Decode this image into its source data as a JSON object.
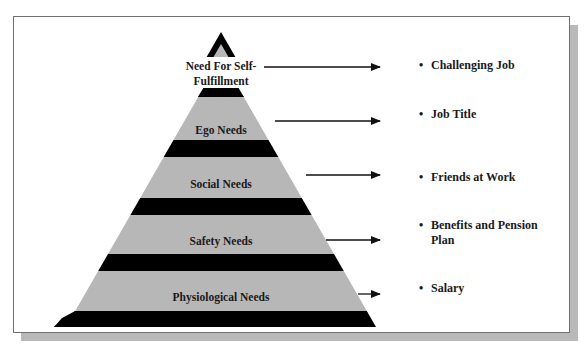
{
  "diagram": {
    "title": "",
    "colors": {
      "band_fill": "#b7b7b7",
      "divider_fill": "#000000",
      "frame_border": "#6f6f6f",
      "shadow": "#b9b9b9",
      "text": "#1a1a1a"
    },
    "levels": [
      {
        "label_line1": "Need For Self-",
        "label_line2": "Fulfillment",
        "example_line1": "Challenging Job",
        "example_line2": ""
      },
      {
        "label_line1": "Ego Needs",
        "label_line2": "",
        "example_line1": "Job Title",
        "example_line2": ""
      },
      {
        "label_line1": "Social Needs",
        "label_line2": "",
        "example_line1": "Friends at Work",
        "example_line2": ""
      },
      {
        "label_line1": "Safety Needs",
        "label_line2": "",
        "example_line1": "Benefits and Pension",
        "example_line2": "Plan"
      },
      {
        "label_line1": "Physiological Needs",
        "label_line2": "",
        "example_line1": "Salary",
        "example_line2": ""
      }
    ],
    "bullet_glyph": "•",
    "arrow_glyph": "arrow-right"
  }
}
